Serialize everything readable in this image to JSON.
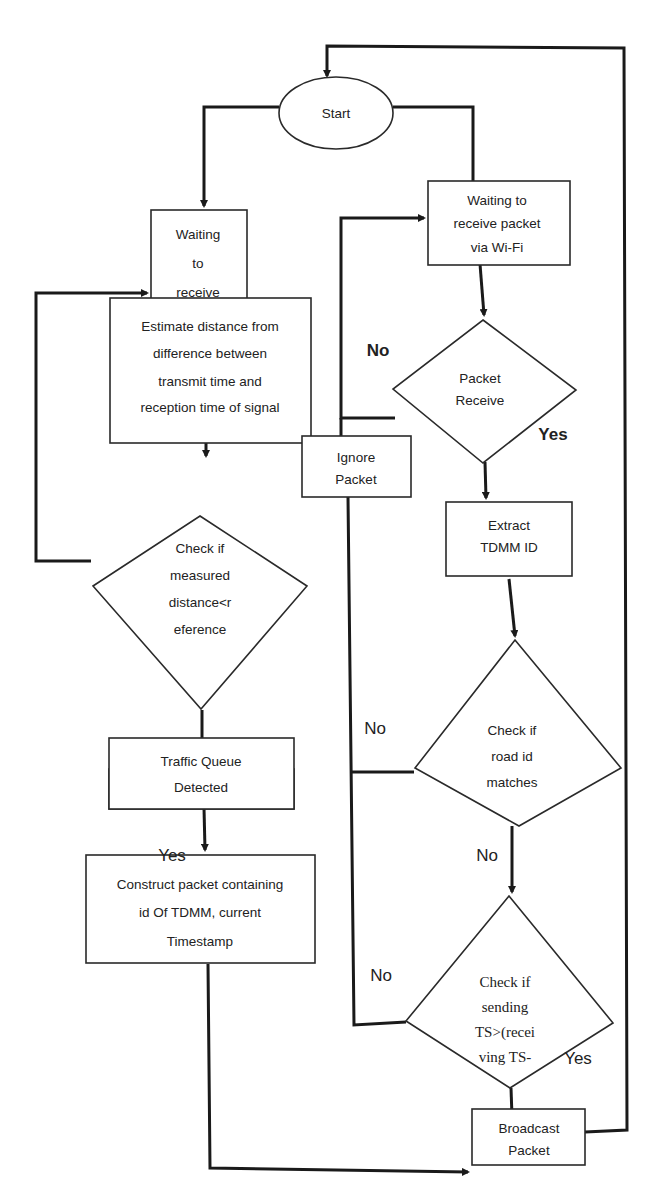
{
  "diagram": {
    "type": "flowchart",
    "colors": {
      "stroke": "#1a1a1a",
      "fill": "#ffffff",
      "text": "#222222"
    },
    "nodes": {
      "start": {
        "shape": "ellipse",
        "lines": [
          "Start"
        ]
      },
      "wait_receive": {
        "shape": "rect",
        "lines": [
          "Waiting",
          "to",
          "receive"
        ]
      },
      "estimate": {
        "shape": "rect",
        "lines": [
          "Estimate distance from",
          "difference between",
          "transmit time and",
          "reception time of signal"
        ]
      },
      "check_distance": {
        "shape": "diamond",
        "lines": [
          "Check if",
          "measured",
          "distance<r",
          "eference"
        ]
      },
      "queue_detected": {
        "shape": "rect",
        "lines": [
          "Traffic Queue",
          "Detected"
        ]
      },
      "construct": {
        "shape": "rect",
        "lines": [
          "Construct packet containing",
          "id Of TDMM, current",
          "Timestamp"
        ]
      },
      "wait_wifi": {
        "shape": "rect",
        "lines": [
          "Waiting to",
          "receive packet",
          "via Wi-Fi"
        ]
      },
      "packet_receive": {
        "shape": "diamond",
        "lines": [
          "Packet",
          "Receive"
        ]
      },
      "ignore": {
        "shape": "rect",
        "lines": [
          "Ignore",
          "Packet"
        ]
      },
      "extract": {
        "shape": "rect",
        "lines": [
          "Extract",
          "TDMM ID"
        ]
      },
      "check_road": {
        "shape": "diamond",
        "lines": [
          "Check if",
          "road id",
          "matches"
        ]
      },
      "check_ts": {
        "shape": "diamond",
        "lines": [
          "Check if",
          "sending",
          "TS>(recei",
          "ving TS-"
        ]
      },
      "broadcast": {
        "shape": "rect",
        "lines": [
          "Broadcast",
          "Packet"
        ]
      }
    },
    "edge_labels": {
      "packet_no": "No",
      "packet_yes": "Yes",
      "road_no_left": "No",
      "road_no_down": "No",
      "ts_no": "No",
      "ts_yes": "Yes",
      "queue_yes": "Yes"
    },
    "edges": [
      {
        "from": "start",
        "to": "wait_receive"
      },
      {
        "from": "start",
        "to": "wait_wifi"
      },
      {
        "from": "wait_receive",
        "to": "estimate"
      },
      {
        "from": "estimate",
        "to": "check_distance"
      },
      {
        "from": "check_distance",
        "to": "wait_receive",
        "note": "loop back"
      },
      {
        "from": "check_distance",
        "to": "queue_detected"
      },
      {
        "from": "queue_detected",
        "to": "construct",
        "label": "Yes"
      },
      {
        "from": "construct",
        "to": "broadcast"
      },
      {
        "from": "wait_wifi",
        "to": "packet_receive"
      },
      {
        "from": "packet_receive",
        "to": "wait_wifi",
        "label": "No"
      },
      {
        "from": "packet_receive",
        "to": "extract",
        "label": "Yes"
      },
      {
        "from": "extract",
        "to": "check_road"
      },
      {
        "from": "check_road",
        "to": "ignore",
        "label": "No"
      },
      {
        "from": "check_road",
        "to": "check_ts",
        "label": "No"
      },
      {
        "from": "check_ts",
        "to": "ignore",
        "label": "No"
      },
      {
        "from": "check_ts",
        "to": "broadcast",
        "label": "Yes"
      },
      {
        "from": "broadcast",
        "to": "start",
        "note": "loop back"
      }
    ]
  }
}
